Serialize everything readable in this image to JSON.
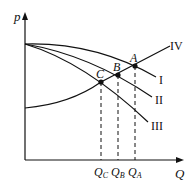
{
  "diagram": {
    "type": "supply-demand curves",
    "axes": {
      "y_label": "p",
      "x_label": "Q"
    },
    "curves": [
      {
        "id": "I",
        "label": "I"
      },
      {
        "id": "II",
        "label": "II"
      },
      {
        "id": "III",
        "label": "III"
      },
      {
        "id": "IV",
        "label": "IV"
      }
    ],
    "points": [
      {
        "id": "A",
        "label": "A",
        "intersection": [
          "I",
          "IV"
        ]
      },
      {
        "id": "B",
        "label": "B",
        "intersection": [
          "II",
          "IV"
        ]
      },
      {
        "id": "C",
        "label": "C",
        "intersection": [
          "III",
          "IV"
        ]
      }
    ],
    "x_ticks": [
      {
        "main": "Q",
        "sub": "C"
      },
      {
        "main": "Q",
        "sub": "B"
      },
      {
        "main": "Q",
        "sub": "A"
      }
    ],
    "colors": {
      "line": "#111111",
      "background": "#ffffff"
    }
  }
}
